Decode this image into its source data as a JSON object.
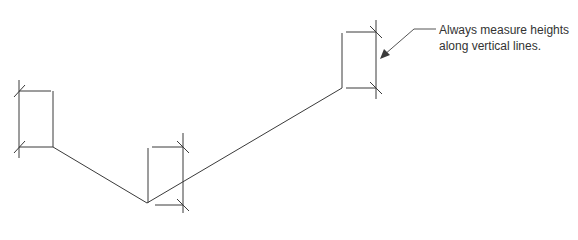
{
  "annotation": {
    "line1": "Always measure heights",
    "line2": "along vertical lines."
  },
  "colors": {
    "line": "#3a3a3a",
    "text": "#333333",
    "background": "#ffffff"
  },
  "profile": {
    "points": [
      [
        53,
        147
      ],
      [
        147,
        203
      ],
      [
        342,
        88
      ]
    ]
  },
  "height_markers": [
    {
      "name": "left",
      "station_x": 53,
      "measure_x": 19,
      "top_y": 91,
      "bottom_y": 147
    },
    {
      "name": "middle",
      "station_x": 148,
      "measure_x": 183,
      "top_y": 147,
      "bottom_y": 205
    },
    {
      "name": "right",
      "station_x": 342,
      "measure_x": 376,
      "top_y": 32,
      "bottom_y": 88
    }
  ]
}
